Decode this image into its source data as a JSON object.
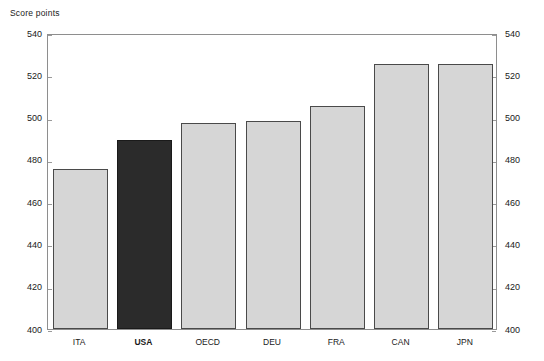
{
  "chart_data": {
    "type": "bar",
    "title": "Score points",
    "xlabel": "",
    "ylabel": "Score points",
    "categories": [
      "ITA",
      "USA",
      "OECD",
      "DEU",
      "FRA",
      "CAN",
      "JPN"
    ],
    "values": [
      475,
      489,
      497,
      498,
      505,
      525,
      525
    ],
    "series": [
      {
        "name": "Score points",
        "values": [
          475,
          489,
          497,
          498,
          505,
          525,
          525
        ]
      }
    ],
    "highlight_category": "USA",
    "highlight_index": 1,
    "ylim": [
      400,
      540
    ],
    "yticks": [
      400,
      420,
      440,
      460,
      480,
      500,
      520,
      540
    ],
    "ytick_labels": [
      "400",
      "420",
      "440",
      "460",
      "480",
      "500",
      "520",
      "540"
    ],
    "right_axis": true,
    "right_ytick_labels": [
      "400",
      "420",
      "440",
      "460",
      "480",
      "500",
      "520",
      "540"
    ],
    "grid": false,
    "legend": null,
    "legend_position": "none",
    "colors": {
      "bar_fill": "#d6d6d6",
      "bar_border": "#4a4a4a",
      "highlight_fill": "#2b2b2b",
      "highlight_border": "#1a1a1a",
      "frame": "#8e8e8e",
      "background": "#ffffff",
      "text": "#1a1a1a"
    }
  }
}
